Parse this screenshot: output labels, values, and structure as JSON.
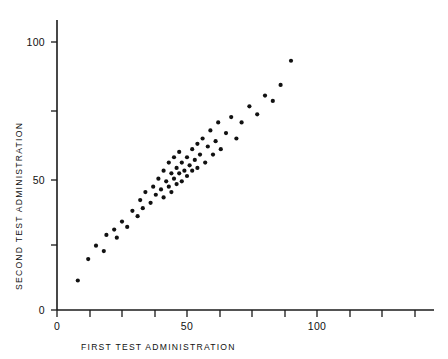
{
  "chart_data": {
    "type": "scatter",
    "title": "",
    "xlabel": "FIRST TEST ADMINISTRATION",
    "ylabel": "SECOND TEST ADMINISTRATION",
    "xlim": [
      0,
      137
    ],
    "ylim": [
      0,
      112
    ],
    "grid": false,
    "legend": null,
    "x_ticks": [
      0,
      12.5,
      25,
      37.5,
      50,
      62.5,
      75,
      87.5,
      100,
      112.5,
      125,
      137.5
    ],
    "x_tick_labels": [
      "0",
      "",
      "",
      "",
      "50",
      "",
      "",
      "",
      "100",
      "",
      "",
      ""
    ],
    "y_ticks": [
      0,
      25,
      50,
      75,
      100
    ],
    "y_tick_labels": [
      "0",
      "",
      "50",
      "",
      "100"
    ],
    "marker": "filled-circle",
    "marker_color": "#111111",
    "marker_size": 4.2,
    "n_points": 60,
    "points": [
      [
        8,
        11
      ],
      [
        12,
        19
      ],
      [
        15,
        24
      ],
      [
        18,
        22
      ],
      [
        19,
        28
      ],
      [
        22,
        30
      ],
      [
        23,
        27
      ],
      [
        25,
        33
      ],
      [
        27,
        31
      ],
      [
        29,
        37
      ],
      [
        31,
        35
      ],
      [
        32,
        41
      ],
      [
        33,
        38
      ],
      [
        34,
        44
      ],
      [
        36,
        40
      ],
      [
        37,
        46
      ],
      [
        38,
        43
      ],
      [
        39,
        49
      ],
      [
        40,
        45
      ],
      [
        41,
        52
      ],
      [
        41,
        42
      ],
      [
        42,
        48
      ],
      [
        43,
        55
      ],
      [
        43,
        46
      ],
      [
        44,
        51
      ],
      [
        44,
        44
      ],
      [
        45,
        57
      ],
      [
        45,
        49
      ],
      [
        46,
        53
      ],
      [
        46,
        47
      ],
      [
        47,
        51
      ],
      [
        47,
        59
      ],
      [
        48,
        55
      ],
      [
        48,
        48
      ],
      [
        49,
        52
      ],
      [
        50,
        57
      ],
      [
        50,
        50
      ],
      [
        51,
        54
      ],
      [
        52,
        60
      ],
      [
        52,
        52
      ],
      [
        53,
        56
      ],
      [
        54,
        62
      ],
      [
        54,
        53
      ],
      [
        55,
        58
      ],
      [
        56,
        64
      ],
      [
        57,
        55
      ],
      [
        58,
        61
      ],
      [
        59,
        67
      ],
      [
        60,
        58
      ],
      [
        61,
        63
      ],
      [
        62,
        70
      ],
      [
        63,
        60
      ],
      [
        65,
        66
      ],
      [
        67,
        72
      ],
      [
        69,
        64
      ],
      [
        71,
        70
      ],
      [
        74,
        76
      ],
      [
        77,
        73
      ],
      [
        80,
        80
      ],
      [
        83,
        78
      ],
      [
        86,
        84
      ],
      [
        90,
        93
      ]
    ]
  },
  "axes": {
    "x_axis_label": "FIRST TEST ADMINISTRATION",
    "y_axis_label": "SECOND TEST ADMINISTRATION",
    "x_labels": [
      {
        "text": "0",
        "value": 0
      },
      {
        "text": "50",
        "value": 50
      },
      {
        "text": "100",
        "value": 100
      }
    ],
    "y_labels": [
      {
        "text": "0",
        "value": 0
      },
      {
        "text": "50",
        "value": 50
      },
      {
        "text": "100",
        "value": 100
      }
    ]
  },
  "colors": {
    "background": "#ffffff",
    "axis": "#1a1a1a",
    "marker": "#111111",
    "text": "#111111"
  }
}
